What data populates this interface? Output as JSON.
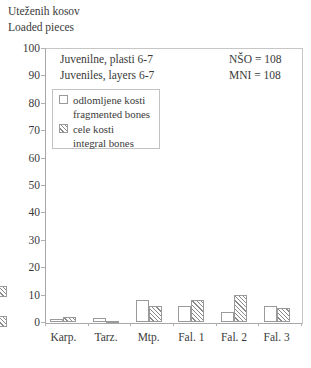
{
  "title": {
    "line1": "Uteženih kosov",
    "line2": "Loaded pieces"
  },
  "annotations": {
    "subtitle_line1": "Juvenilne, plasti 6-7",
    "subtitle_line2": "Juveniles, layers 6-7",
    "stat_line1": "NŠO = 108",
    "stat_line2": "MNI = 108"
  },
  "legend": {
    "items": [
      {
        "swatch": "plain",
        "line1": "odlomljene kosti",
        "line2": "fragmented bones"
      },
      {
        "swatch": "hatched",
        "line1": "cele kosti",
        "line2": "integral bones"
      }
    ]
  },
  "chart_data": {
    "type": "bar",
    "categories": [
      "Karp.",
      "Tarz.",
      "Mtp.",
      "Fal. 1",
      "Fal. 2",
      "Fal. 3"
    ],
    "series": [
      {
        "name": "odlomljene kosti / fragmented bones",
        "style": "plain",
        "values": [
          1,
          1.5,
          8,
          6,
          3.5,
          6
        ]
      },
      {
        "name": "cele kosti / integral bones",
        "style": "hatched",
        "values": [
          2,
          0.5,
          6,
          8,
          10,
          5
        ]
      }
    ],
    "xlabel": "",
    "ylabel": "Uteženih kosov / Loaded pieces",
    "ylim": [
      0,
      100
    ],
    "ytick_step": 10,
    "grid": false,
    "legend_position": "upper-left-inside"
  },
  "axis": {
    "yticks": [
      0,
      10,
      20,
      30,
      40,
      50,
      60,
      70,
      80,
      90,
      100
    ]
  },
  "colors": {
    "text": "#3a3a3a",
    "axis": "#a8a8a8",
    "plot_border": "#c6c6c6",
    "bar_border": "#9a9a9a",
    "hatch": "#8b8b8b",
    "background": "#ffffff"
  }
}
